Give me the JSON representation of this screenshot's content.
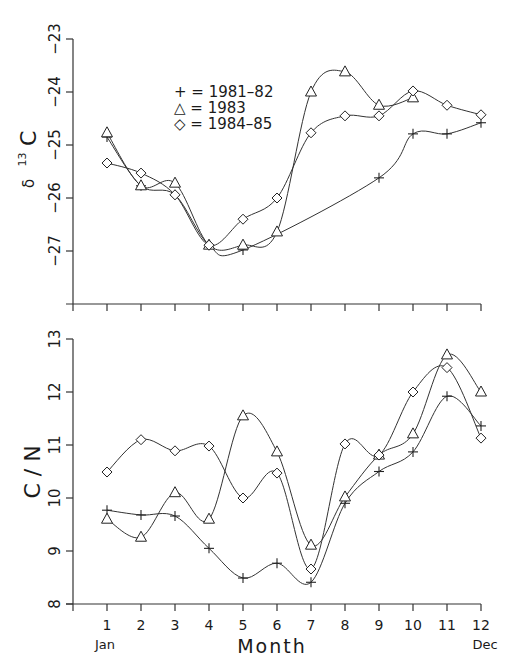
{
  "chart_data": [
    {
      "type": "line",
      "title": "",
      "xlabel": "",
      "ylabel": "δ 13C",
      "ylabel_parts": {
        "symbol": "δ",
        "superscript": "13",
        "element": "C"
      },
      "x": [
        1,
        2,
        3,
        4,
        5,
        6,
        7,
        8,
        9,
        10,
        11,
        12
      ],
      "xlim": [
        0,
        12
      ],
      "ylim": [
        -28,
        -23
      ],
      "yticks": [
        -23,
        -24,
        -25,
        -26,
        -27
      ],
      "ytick_labels": [
        "−23",
        "−24",
        "−25",
        "−26",
        "−27"
      ],
      "grid": false,
      "legend_position": "upper-left-center",
      "legend": [
        {
          "marker": "+",
          "label": "+ = 1981–82"
        },
        {
          "marker": "△",
          "label": "△ = 1983"
        },
        {
          "marker": "◇",
          "label": "◇ = 1984–85"
        }
      ],
      "series": [
        {
          "name": "1981-82",
          "marker": "plus",
          "values": [
            -24.85,
            -25.77,
            -25.94,
            -26.89,
            -26.98,
            null,
            null,
            null,
            -25.62,
            -24.79,
            -24.79,
            -24.58
          ]
        },
        {
          "name": "1983",
          "marker": "triangle",
          "values": [
            -24.77,
            -25.77,
            -25.72,
            -26.89,
            -26.89,
            -26.64,
            -24.0,
            -23.62,
            -24.25,
            -24.11,
            null,
            null
          ]
        },
        {
          "name": "1984-85",
          "marker": "diamond",
          "values": [
            -25.34,
            -25.53,
            -25.94,
            -26.89,
            -26.4,
            -26.0,
            -24.77,
            -24.45,
            -24.45,
            -23.98,
            -24.25,
            -24.43
          ]
        }
      ]
    },
    {
      "type": "line",
      "title": "",
      "xlabel": "Month",
      "ylabel": "C / N",
      "x": [
        1,
        2,
        3,
        4,
        5,
        6,
        7,
        8,
        9,
        10,
        11,
        12
      ],
      "xlim": [
        0,
        12
      ],
      "ylim": [
        8,
        13
      ],
      "yticks": [
        8,
        9,
        10,
        11,
        12,
        13
      ],
      "ytick_labels": [
        "8",
        "9",
        "10",
        "11",
        "12",
        "13"
      ],
      "xtick_labels": [
        "1",
        "2",
        "3",
        "4",
        "5",
        "6",
        "7",
        "8",
        "9",
        "10",
        "11",
        "12"
      ],
      "x_end_labels": {
        "start": "Jan",
        "end": "Dec"
      },
      "grid": false,
      "series": [
        {
          "name": "1981-82",
          "marker": "plus",
          "values": [
            9.77,
            9.68,
            9.66,
            9.05,
            8.49,
            8.77,
            8.41,
            9.9,
            10.5,
            10.87,
            11.92,
            11.36
          ]
        },
        {
          "name": "1983",
          "marker": "triangle",
          "values": [
            9.6,
            9.26,
            10.1,
            9.6,
            11.55,
            10.87,
            9.11,
            10.02,
            10.81,
            11.21,
            12.7,
            12.0
          ]
        },
        {
          "name": "1984-85",
          "marker": "diamond",
          "values": [
            10.49,
            11.1,
            10.89,
            10.98,
            10.0,
            10.47,
            8.66,
            11.02,
            10.81,
            12.0,
            12.46,
            11.13
          ]
        }
      ]
    }
  ],
  "labels": {
    "top_ylabel_symbol": "δ",
    "top_ylabel_sup": "13",
    "top_ylabel_el": "C",
    "bottom_ylabel": "C / N",
    "xlabel": "Month",
    "jan": "Jan",
    "dec": "Dec",
    "legend": [
      "+ = 1981–82",
      "△ = 1983",
      "◇ = 1984–85"
    ]
  }
}
